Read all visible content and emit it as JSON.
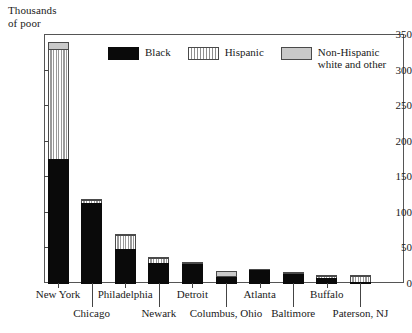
{
  "chart_data": {
    "type": "bar",
    "subtype": "stacked",
    "title": "Thousands\nof poor",
    "xlabel": "",
    "ylabel": "Thousands of poor",
    "ylim": [
      0,
      350
    ],
    "yticks": [
      0,
      50,
      100,
      150,
      200,
      250,
      300,
      350
    ],
    "grid": false,
    "legend_position": "top-center-inside",
    "categories": [
      "New York",
      "Chicago",
      "Philadelphia",
      "Newark",
      "Detroit",
      "Columbus, Ohio",
      "Atlanta",
      "Baltimore",
      "Buffalo",
      "Paterson, NJ"
    ],
    "series": [
      {
        "name": "Black",
        "color": "#0a0a0a",
        "pattern": "solid",
        "values": [
          176,
          114,
          49,
          29,
          28,
          10,
          19,
          14,
          8,
          3
        ]
      },
      {
        "name": "Hispanic",
        "color": "#ffffff",
        "pattern": "vertical-stripes",
        "values": [
          156,
          5,
          21,
          9,
          1,
          2,
          1,
          1,
          5,
          9
        ]
      },
      {
        "name": "Non-Hispanic white and other",
        "color": "#c9c9c9",
        "pattern": "solid-gray",
        "values": [
          11,
          3,
          2,
          1,
          3,
          9,
          0,
          2,
          1,
          1
        ]
      }
    ],
    "totals": [
      343,
      122,
      72,
      39,
      32,
      21,
      20,
      17,
      14,
      13
    ]
  },
  "axis": {
    "title_text": "Thousands\nof poor",
    "ytick_labels": [
      "350",
      "300",
      "250",
      "200",
      "150",
      "100",
      "50",
      "0"
    ]
  },
  "legend": {
    "items": [
      {
        "label": "Black",
        "swatch": "swatch-black"
      },
      {
        "label": "Hispanic",
        "swatch": "swatch-hispanic"
      },
      {
        "label": "Non-Hispanic\nwhite and other",
        "swatch": "swatch-gray"
      }
    ]
  }
}
